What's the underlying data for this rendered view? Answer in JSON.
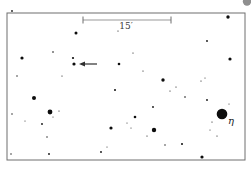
{
  "figure": {
    "background_color": "#ffffff",
    "star_color": "#0d0d0d",
    "frame": {
      "x": 7,
      "y": 13,
      "width": 238,
      "height": 147,
      "stroke": "#6e6e6e",
      "fill": "#ffffff"
    },
    "scale_bar": {
      "label": "15′",
      "x1": 83,
      "x2": 171,
      "y": 20,
      "tick_half_height": 3.5,
      "label_x": 126,
      "label_y": 29,
      "line_color": "#9a9a9a",
      "tick_color": "#6f6f6f",
      "label_color": "#3a3a3a",
      "label_font_size": 9
    },
    "arrow": {
      "tip_x": 79,
      "tip_y": 64,
      "tail_x": 97,
      "tail_y": 64,
      "color": "#2e2e2e"
    },
    "eta_label": {
      "text": "η",
      "x": 228,
      "y": 124,
      "color": "#1a1a1a",
      "font_size": 10
    },
    "stars": [
      [
        228,
        17,
        1.7
      ],
      [
        76,
        33,
        1.5
      ],
      [
        118,
        31,
        0.6
      ],
      [
        207,
        41,
        0.9
      ],
      [
        133,
        53,
        0.6
      ],
      [
        53,
        52,
        0.8
      ],
      [
        22,
        58,
        1.6
      ],
      [
        73,
        58,
        1.1
      ],
      [
        74,
        64,
        1.6
      ],
      [
        119,
        64,
        1.3
      ],
      [
        230,
        59,
        1.6
      ],
      [
        143,
        71,
        0.6
      ],
      [
        17,
        76,
        0.7
      ],
      [
        62,
        76,
        0.6
      ],
      [
        163,
        80,
        1.7
      ],
      [
        201,
        81,
        0.6
      ],
      [
        205,
        78,
        0.5
      ],
      [
        176,
        87,
        0.6
      ],
      [
        170,
        91,
        0.6
      ],
      [
        185,
        97,
        0.8
      ],
      [
        115,
        90,
        1.0
      ],
      [
        34,
        98,
        2.0
      ],
      [
        207,
        100,
        0.9
      ],
      [
        229,
        104,
        0.5
      ],
      [
        153,
        107,
        0.9
      ],
      [
        50,
        112,
        2.4
      ],
      [
        59,
        111,
        0.6
      ],
      [
        53,
        117,
        0.5
      ],
      [
        12,
        114,
        0.7
      ],
      [
        25,
        121,
        0.5
      ],
      [
        42,
        124,
        0.9
      ],
      [
        111,
        128,
        1.6
      ],
      [
        135,
        117,
        1.3
      ],
      [
        127,
        123,
        0.5
      ],
      [
        131,
        128,
        0.5
      ],
      [
        222,
        114,
        5.3
      ],
      [
        212,
        122,
        0.6
      ],
      [
        210,
        130,
        0.5
      ],
      [
        154,
        130,
        2.2
      ],
      [
        147,
        136,
        0.6
      ],
      [
        217,
        136,
        0.6
      ],
      [
        165,
        145,
        0.7
      ],
      [
        182,
        144,
        1.0
      ],
      [
        47,
        137,
        0.7
      ],
      [
        107,
        147,
        0.5
      ],
      [
        11,
        154,
        0.7
      ],
      [
        49,
        154,
        0.9
      ],
      [
        101,
        152,
        0.9
      ],
      [
        202,
        157,
        1.6
      ]
    ],
    "artifacts": [
      {
        "name": "margin-dot",
        "x": 12,
        "y": 11,
        "r": 0.9,
        "color": "#1a1a1a"
      },
      {
        "name": "page-corner-blob",
        "x": 247,
        "y": 1.5,
        "r": 4.2,
        "color": "#8f8f8f"
      }
    ]
  }
}
